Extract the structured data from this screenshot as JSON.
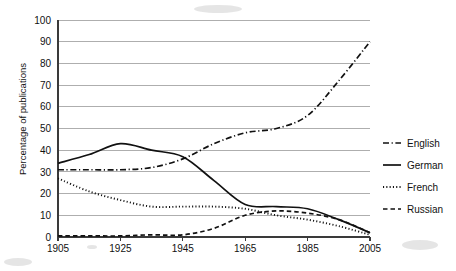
{
  "chart_data": {
    "type": "line",
    "title": "",
    "xlabel": "",
    "ylabel": "Percentage of publications",
    "xlim": [
      1905,
      2005
    ],
    "ylim": [
      0,
      100
    ],
    "grid": true,
    "legend_position": "right",
    "x_tick_labels": [
      "1905",
      "1925",
      "1945",
      "1965",
      "1985",
      "2005"
    ],
    "x_ticks": [
      1905,
      1925,
      1945,
      1965,
      1985,
      2005
    ],
    "y_tick_labels": [
      "0",
      "10",
      "20",
      "30",
      "40",
      "50",
      "60",
      "70",
      "80",
      "90",
      "100"
    ],
    "y_ticks": [
      0,
      10,
      20,
      30,
      40,
      50,
      60,
      70,
      80,
      90,
      100
    ],
    "series": [
      {
        "name": "English",
        "line_style": "dash-dot",
        "color": "#111111",
        "x": [
          1905,
          1915,
          1925,
          1935,
          1945,
          1955,
          1965,
          1975,
          1985,
          1995,
          2005
        ],
        "values": [
          31,
          31,
          31,
          32,
          36,
          43,
          48,
          50,
          56,
          72,
          90
        ]
      },
      {
        "name": "German",
        "line_style": "solid",
        "color": "#111111",
        "x": [
          1905,
          1915,
          1925,
          1935,
          1945,
          1955,
          1965,
          1975,
          1985,
          1995,
          2005
        ],
        "values": [
          34,
          38,
          43,
          40,
          37,
          26,
          15,
          14,
          13,
          8,
          2
        ]
      },
      {
        "name": "French",
        "line_style": "dotted",
        "color": "#111111",
        "x": [
          1905,
          1915,
          1925,
          1935,
          1945,
          1955,
          1965,
          1975,
          1985,
          1995,
          2005
        ],
        "values": [
          27,
          21,
          17,
          14,
          14,
          14,
          13,
          10,
          8,
          5,
          1
        ]
      },
      {
        "name": "Russian",
        "line_style": "dashed",
        "color": "#111111",
        "x": [
          1905,
          1915,
          1925,
          1935,
          1945,
          1955,
          1965,
          1975,
          1985,
          1995,
          2005
        ],
        "values": [
          0.5,
          0.5,
          0.5,
          1,
          1,
          4,
          10,
          12,
          11,
          8,
          2
        ]
      }
    ]
  },
  "legend": {
    "entries": [
      {
        "label": "English"
      },
      {
        "label": "German"
      },
      {
        "label": "French"
      },
      {
        "label": "Russian"
      }
    ]
  }
}
